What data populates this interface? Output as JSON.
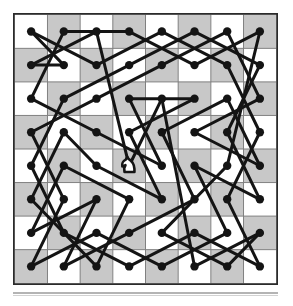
{
  "figure": {
    "type": "knight-tour-diagram",
    "board": {
      "files": 8,
      "ranks": 8,
      "light_square_color": "#ffffff",
      "dark_square_color": "#c8c8c8",
      "border_color": "#2b2b2b",
      "grid_line_color": "#808080",
      "origin_square_color": "light",
      "file_labels": [
        "a",
        "b",
        "c",
        "d",
        "e",
        "f",
        "g",
        "h"
      ],
      "rank_labels": [
        "8",
        "7",
        "6",
        "5",
        "4",
        "3",
        "2",
        "1"
      ]
    },
    "graph": {
      "node_color": "#141414",
      "node_radius": 4.2,
      "edge_color": "#141414",
      "edge_width": 3.0,
      "node_count": 64,
      "edge_count": 64,
      "closed": true
    },
    "piece_marker": {
      "glyph": "knight",
      "fill": "#ffffff",
      "stroke": "#141414",
      "col": 3,
      "row": 4
    },
    "rule": {
      "color": "#b4b4b4",
      "present": true
    }
  },
  "chart_data": {
    "type": "scatter",
    "xlabel": "",
    "ylabel": "",
    "xlim": [
      0,
      7
    ],
    "ylim": [
      0,
      7
    ],
    "grid": true,
    "legend": null,
    "tour_sequence": [
      [
        0,
        0
      ],
      [
        2,
        1
      ],
      [
        4,
        0
      ],
      [
        6,
        1
      ],
      [
        7,
        3
      ],
      [
        6,
        5
      ],
      [
        7,
        7
      ],
      [
        5,
        6
      ],
      [
        3,
        7
      ],
      [
        1,
        6
      ],
      [
        0,
        4
      ],
      [
        1,
        2
      ],
      [
        3,
        1
      ],
      [
        5,
        0
      ],
      [
        7,
        1
      ],
      [
        6,
        3
      ],
      [
        7,
        5
      ],
      [
        5,
        4
      ],
      [
        6,
        6
      ],
      [
        4,
        7
      ],
      [
        2,
        6
      ],
      [
        0,
        7
      ],
      [
        1,
        5
      ],
      [
        0,
        3
      ],
      [
        2,
        2
      ],
      [
        4,
        1
      ],
      [
        6,
        0
      ],
      [
        7,
        2
      ],
      [
        5,
        3
      ],
      [
        7,
        4
      ],
      [
        6,
        2
      ],
      [
        4,
        3
      ],
      [
        5,
        5
      ],
      [
        3,
        6
      ],
      [
        1,
        7
      ],
      [
        2,
        5
      ],
      [
        0,
        6
      ],
      [
        1,
        4
      ],
      [
        3,
        5
      ],
      [
        2,
        7
      ],
      [
        0,
        5
      ],
      [
        1,
        3
      ],
      [
        2,
        4
      ],
      [
        4,
        5
      ],
      [
        3,
        3
      ],
      [
        5,
        2
      ],
      [
        3,
        2
      ],
      [
        4,
        4
      ],
      [
        2,
        3
      ],
      [
        0,
        2
      ],
      [
        1,
        0
      ],
      [
        3,
        0
      ],
      [
        5,
        1
      ],
      [
        7,
        0
      ],
      [
        6,
        4
      ],
      [
        4,
        6
      ],
      [
        6,
        7
      ],
      [
        7,
        6
      ],
      [
        5,
        7
      ],
      [
        4,
        2
      ],
      [
        3,
        4
      ],
      [
        2,
        0
      ],
      [
        0,
        1
      ],
      [
        1,
        1
      ]
    ]
  }
}
